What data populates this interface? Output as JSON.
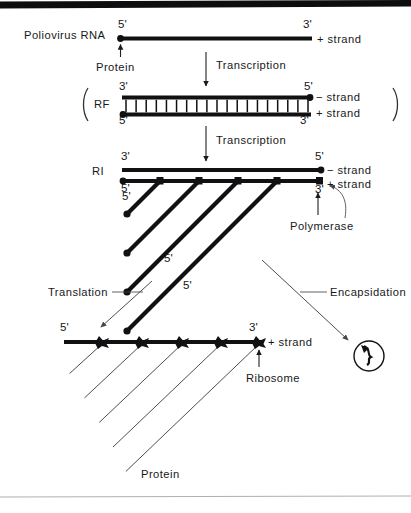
{
  "figure": {
    "top_rule": true,
    "bottom_rule": true,
    "caption": ""
  },
  "stages": {
    "genome": {
      "name_label": "Poliovirus RNA",
      "five_prime": "5'",
      "three_prime": "3'",
      "strand_label": "+ strand",
      "protein_label": "Protein"
    },
    "rf": {
      "name_label": "RF",
      "bracket_open": "(",
      "bracket_close": ")",
      "top_left_prime": "3'",
      "top_right_prime": "5'",
      "bottom_left_prime": "5'",
      "bottom_right_prime": "3'",
      "minus_strand_label": "− strand",
      "plus_strand_label": "+ strand",
      "rung_count": 18
    },
    "ri": {
      "name_label": "RI",
      "top_left_prime": "3'",
      "top_right_prime": "5'",
      "bottom_left_prime": "5'",
      "bottom_right_prime": "3'",
      "minus_strand_label": "− strand",
      "plus_strand_label": "+ strand",
      "polymerase_label": "Polymerase",
      "nascent_prime_labels": [
        "5'",
        "5'",
        "5'"
      ],
      "nascent_count": 5
    },
    "polysome": {
      "five_prime": "5'",
      "three_prime": "3'",
      "strand_label": "+ strand",
      "ribosome_label": "Ribosome",
      "protein_label": "Protein",
      "ribosome_count": 5
    },
    "virion": {
      "label": ""
    }
  },
  "arrows": {
    "transcription_1": "Transcription",
    "transcription_2": "Transcription",
    "translation": "Translation",
    "encapsidation": "Encapsidation"
  },
  "colors": {
    "ink": "#111113",
    "thin_ink": "#3a3a3e",
    "paper": "#ffffff",
    "rule": "#9a9aa0"
  }
}
